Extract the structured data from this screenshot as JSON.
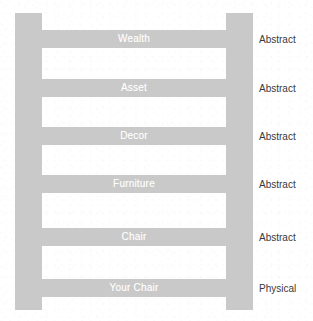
{
  "figure": {
    "width": 313,
    "height": 321,
    "background_color": "#ffffff",
    "ladder_color": "#c9c9c9",
    "rung_text_color": "#ffffff",
    "side_label_color": "#3a3a3a"
  },
  "ladder": {
    "rungs": [
      {
        "label": "Wealth",
        "side_label": "Abstract"
      },
      {
        "label": "Asset",
        "side_label": "Abstract"
      },
      {
        "label": "Decor",
        "side_label": "Abstract"
      },
      {
        "label": "Furniture",
        "side_label": "Abstract"
      },
      {
        "label": "Chair",
        "side_label": "Abstract"
      },
      {
        "label": "Your Chair",
        "side_label": "Physical"
      }
    ]
  }
}
